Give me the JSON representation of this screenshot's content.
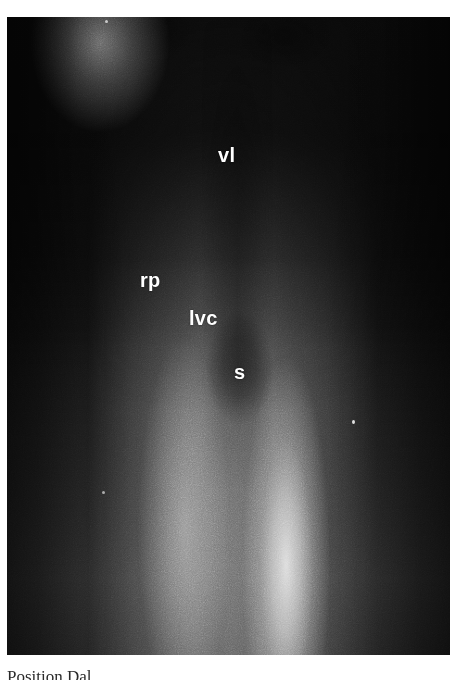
{
  "figure": {
    "kind": "radiograph",
    "modality_hint": "venogram / contrast radiograph",
    "plate": {
      "x": 7,
      "y": 17,
      "width": 443,
      "height": 638,
      "background_hex": "#151515",
      "label_color_hex": "#ffffff"
    },
    "annotations": [
      {
        "id": "vl",
        "text": "vl",
        "meaning": "lumbar vein",
        "x": 211,
        "y": 128
      },
      {
        "id": "rp",
        "text": "rp",
        "meaning": "renal pelvis",
        "x": 133,
        "y": 253
      },
      {
        "id": "lvc",
        "text": "lvc",
        "meaning": "left vena cava",
        "x": 182,
        "y": 291
      },
      {
        "id": "s",
        "text": "s",
        "meaning": "stomach / shadow",
        "x": 227,
        "y": 345
      }
    ],
    "artifacts": [
      {
        "id": "speck-a",
        "x": 345,
        "y": 403
      },
      {
        "id": "speck-b",
        "x": 95,
        "y": 474
      },
      {
        "id": "speck-c",
        "x": 98,
        "y": 3
      }
    ]
  },
  "caption": {
    "text": "Position  Dal",
    "note": "clipped at bottom page edge; only the tops of the glyphs are visible",
    "color_hex": "#2a2a2a"
  }
}
